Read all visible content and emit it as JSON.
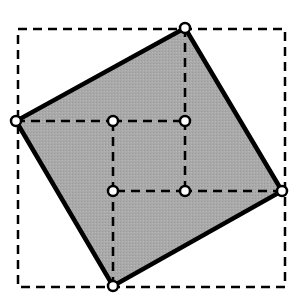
{
  "diagram": {
    "colors": {
      "background": "#ffffff",
      "fill": "#a9a9a9",
      "stroke": "#000000",
      "point_fill": "#ffffff"
    },
    "outer_square": {
      "x1": 18,
      "y1": 29,
      "x2": 285,
      "y2": 287,
      "style": "dashed"
    },
    "tilted_square": {
      "vertices": [
        {
          "name": "top",
          "x": 185,
          "y": 28
        },
        {
          "name": "right",
          "x": 282,
          "y": 191
        },
        {
          "name": "bottom",
          "x": 113,
          "y": 286
        },
        {
          "name": "left",
          "x": 16,
          "y": 121
        }
      ],
      "style": "solid"
    },
    "inner_square": {
      "vertices": [
        {
          "name": "inner-top-left",
          "x": 113,
          "y": 121
        },
        {
          "name": "inner-top-right",
          "x": 185,
          "y": 121
        },
        {
          "name": "inner-bottom-right",
          "x": 185,
          "y": 191
        },
        {
          "name": "inner-bottom-left",
          "x": 113,
          "y": 191
        }
      ],
      "style": "dashed"
    },
    "dashed_lines": [
      {
        "name": "left-to-inner-top-left",
        "x1": 16,
        "y1": 121,
        "x2": 113,
        "y2": 121
      },
      {
        "name": "top-to-inner-top-right",
        "x1": 185,
        "y1": 28,
        "x2": 185,
        "y2": 121
      },
      {
        "name": "right-to-inner-bottom-right",
        "x1": 282,
        "y1": 191,
        "x2": 185,
        "y2": 191
      },
      {
        "name": "bottom-to-inner-bottom-left",
        "x1": 113,
        "y1": 286,
        "x2": 113,
        "y2": 191
      }
    ]
  }
}
